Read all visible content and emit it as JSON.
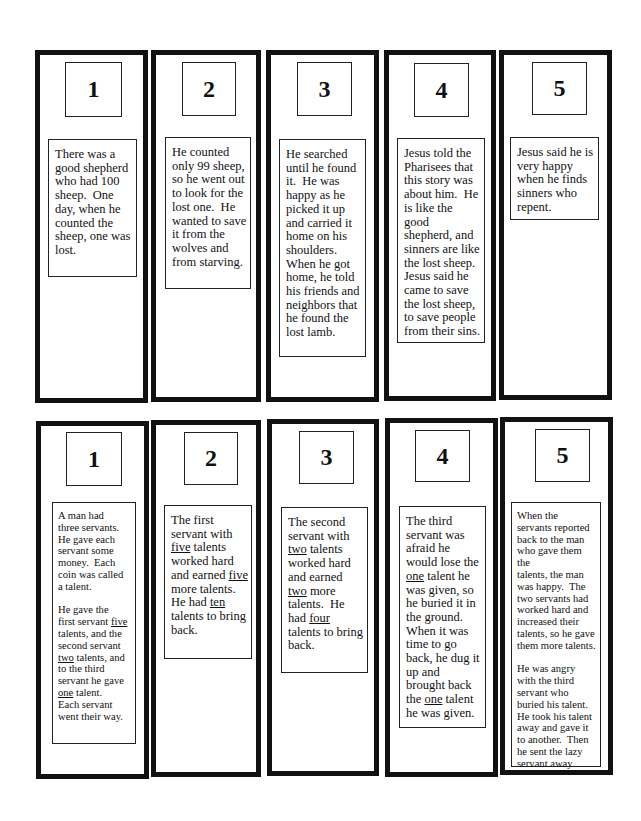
{
  "page": {
    "story_sets": [
      {
        "name": "lost-sheep",
        "cards": [
          {
            "number": "1",
            "text": [
              "There was a good shepherd who had 100 sheep.  One day, when he counted the sheep, one was lost."
            ]
          },
          {
            "number": "2",
            "text": [
              "He counted only 99 sheep, so he went out to look for the lost one.  He wanted to save it from the wolves and from starving."
            ]
          },
          {
            "number": "3",
            "text": [
              "He searched until he found it.  He was happy as he picked it up and carried it home on his shoulders.  When he got home, he told his friends and neighbors that he found the lost lamb."
            ]
          },
          {
            "number": "4",
            "text": [
              "Jesus told the Pharisees that this story was about him.  He is like the good shepherd, and sinners are like the lost sheep.  Jesus said he came to save the lost sheep, to save people from their sins."
            ]
          },
          {
            "number": "5",
            "text": [
              "Jesus said he is very happy when he finds sinners who repent."
            ]
          }
        ]
      },
      {
        "name": "talents",
        "cards": [
          {
            "number": "1",
            "text": [
              "A man had three servants.  He gave each servant some money.  Each coin was called a talent.",
              "He gave the first servant five talents, and the second servant two talents, and to the third servant he gave one talent.  Each servant went their way."
            ],
            "underlined": [
              "five",
              "two",
              "one"
            ]
          },
          {
            "number": "2",
            "text": [
              "The first servant with five talents worked hard and earned five more talents.  He had ten talents to bring back."
            ],
            "underlined": [
              "five",
              "five",
              "ten"
            ]
          },
          {
            "number": "3",
            "text": [
              "The second servant with two talents worked hard and earned two more talents.  He had four talents to bring back."
            ],
            "underlined": [
              "two",
              "two",
              "four"
            ]
          },
          {
            "number": "4",
            "text": [
              "The third servant was afraid he would lose the one talent he was given, so he buried it in the ground.  When it was time to go back, he dug it up and brought back the one talent he was given."
            ],
            "underlined": [
              "one",
              "one"
            ]
          },
          {
            "number": "5",
            "text": [
              "When the servants reported back to the man who gave them the talents, the man was happy.  The two servants had worked hard and increased their talents, so he gave them more talents.",
              "He was angry with the third servant who buried his talent.  He took his talent away and gave it to another.  Then he sent the lazy servant away."
            ]
          }
        ]
      }
    ],
    "lines": {
      "t1c1": [
        "There was a",
        "good shepherd",
        "who had 100",
        "sheep.  One",
        "day, when he",
        "counted the",
        "sheep, one was",
        "lost."
      ],
      "t1c2": [
        "He counted",
        "only 99 sheep,",
        "so he went out",
        "to look for the",
        "lost one.  He",
        "wanted to save",
        "it from the",
        "wolves and",
        "from starving."
      ],
      "t1c3": [
        "He searched",
        "until he found",
        "it.  He was",
        "happy as he",
        "picked it up",
        "and carried it",
        "home on his",
        "shoulders.",
        "When he got",
        "home, he told",
        "his friends and",
        "neighbors that",
        "he found the",
        "lost lamb."
      ],
      "t1c4": [
        "Jesus told the",
        "Pharisees that",
        "this story was",
        "about him.  He",
        "is like the",
        "good",
        "shepherd, and",
        "sinners are like",
        "the lost sheep.",
        "Jesus said he",
        "came to save",
        "the lost sheep,",
        "to save people",
        "from their sins."
      ],
      "t1c5": [
        "Jesus said he is",
        "very happy",
        "when he finds",
        "sinners who",
        "repent."
      ],
      "t2c1_p1": [
        "A man had",
        "three servants.",
        "He gave each",
        "servant some",
        "money.  Each",
        "coin was called",
        "a talent."
      ],
      "t2c1_p2": {
        "l1": "He gave the",
        "l2a": "first servant ",
        "l2u": "five",
        "l3": "talents, and the",
        "l4": "second servant",
        "l5u": "two",
        "l5b": " talents, and",
        "l6": "to the third",
        "l7": "servant he gave",
        "l8u": "one",
        "l8b": " talent.",
        "l9": "Each servant",
        "l10": "went their way."
      },
      "t2c2": {
        "l1": "The first",
        "l2": "servant with",
        "l3u": "five",
        "l3b": " talents",
        "l4": "worked hard",
        "l5a": "and earned ",
        "l5u": "five",
        "l6": "more talents.",
        "l7a": "He had ",
        "l7u": "ten",
        "l8": "talents to bring",
        "l9": "back."
      },
      "t2c3": {
        "l1": "The second",
        "l2": "servant with",
        "l3u": "two",
        "l3b": " talents",
        "l4": "worked hard",
        "l5": "and earned",
        "l6u": "two",
        "l6b": " more",
        "l7": "talents.  He",
        "l8a": "had ",
        "l8u": "four",
        "l9": "talents to bring",
        "l10": "back."
      },
      "t2c4": {
        "l1": "The third",
        "l2": "servant was",
        "l3": "afraid he",
        "l4": "would lose the",
        "l5u": "one",
        "l5b": " talent he",
        "l6": "was given, so",
        "l7": "he buried it in",
        "l8": "the ground.",
        "l9": "When it was",
        "l10": "time to go",
        "l11": "back, he dug it",
        "l12": "up and",
        "l13": "brought back",
        "l14a": "the ",
        "l14u": "one",
        "l14b": " talent",
        "l15": "he was given."
      },
      "t2c5_p1": [
        "When the",
        "servants reported",
        "back to the man",
        "who gave them the",
        "talents, the man",
        "was happy.  The",
        "two servants had",
        "worked hard and",
        "increased their",
        "talents, so he gave",
        "them more talents."
      ],
      "t2c5_p2": [
        "He was angry",
        "with the third",
        "servant who",
        "buried his talent.",
        "He took his talent",
        "away and gave it",
        "to another.  Then",
        "he sent the lazy",
        "servant away."
      ]
    }
  }
}
